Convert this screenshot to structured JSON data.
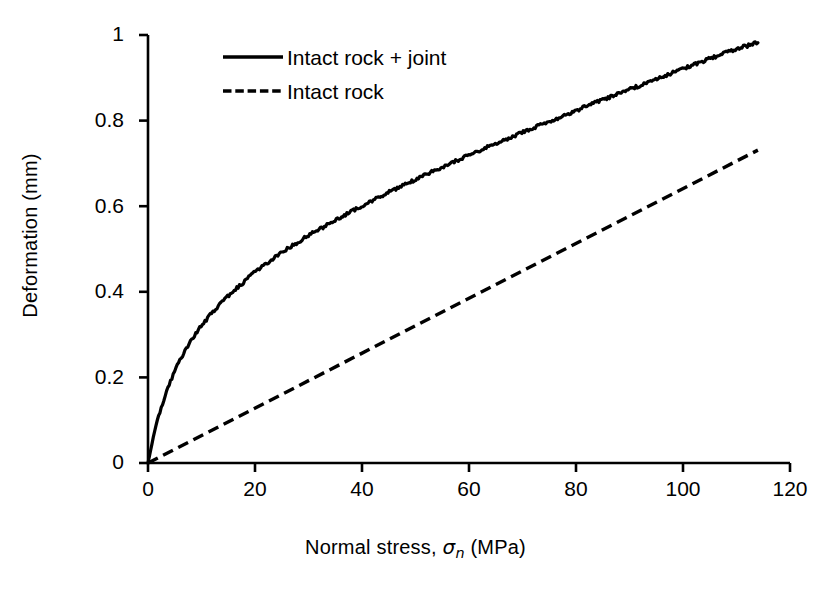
{
  "chart_data": {
    "type": "line",
    "title": "",
    "subtitle": "",
    "xlabel": "Normal stress, σn (MPa)",
    "ylabel": "Deformation (mm)",
    "xlim": [
      0,
      120
    ],
    "ylim": [
      0,
      1
    ],
    "xticks": [
      0,
      20,
      40,
      60,
      80,
      100,
      120
    ],
    "yticks": [
      0,
      0.2,
      0.4,
      0.6,
      0.8,
      1
    ],
    "xtick_labels": [
      "0",
      "20",
      "40",
      "60",
      "80",
      "100",
      "120"
    ],
    "ytick_labels": [
      "0",
      "0.2",
      "0.4",
      "0.6",
      "0.8",
      "1"
    ],
    "grid": false,
    "legend_position": "upper-left-inside",
    "series": [
      {
        "name": "Intact rock + joint",
        "style": "solid",
        "color": "#000000",
        "x": [
          0,
          1,
          2,
          3,
          4,
          5,
          6,
          8,
          10,
          12,
          15,
          20,
          25,
          30,
          35,
          40,
          45,
          50,
          55,
          60,
          65,
          70,
          75,
          80,
          85,
          90,
          95,
          100,
          105,
          110,
          114
        ],
        "y": [
          0,
          0.045,
          0.082,
          0.112,
          0.138,
          0.161,
          0.181,
          0.214,
          0.241,
          0.264,
          0.293,
          0.335,
          0.369,
          0.399,
          0.426,
          0.451,
          0.475,
          0.497,
          0.519,
          0.54,
          0.56,
          0.58,
          0.599,
          0.618,
          0.637,
          0.655,
          0.673,
          0.691,
          0.709,
          0.726,
          0.737
        ]
      },
      {
        "name": "Intact rock",
        "style": "dashed",
        "color": "#000000",
        "x": [
          0,
          114
        ],
        "y": [
          0,
          0.731
        ]
      }
    ]
  },
  "axes": {
    "x_title_prefix": "Normal stress, ",
    "x_title_symbol": "σ",
    "x_title_subscript": "n",
    "x_title_suffix": " (MPa)",
    "y_title": "Deformation (mm)"
  },
  "legend": {
    "items": [
      {
        "label": "Intact rock + joint",
        "style": "solid"
      },
      {
        "label": "Intact rock",
        "style": "dashed"
      }
    ]
  },
  "colors": {
    "line": "#000000",
    "axis": "#000000",
    "background": "#ffffff"
  }
}
